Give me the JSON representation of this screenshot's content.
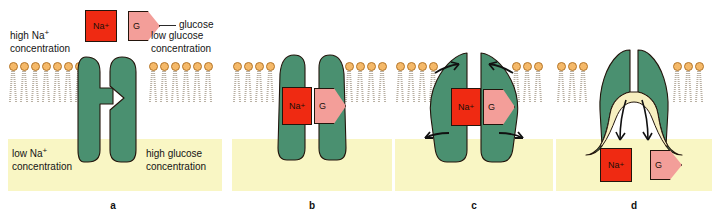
{
  "figure": {
    "colors": {
      "protein_green": "#4a9070",
      "lipid_head_orange": "#f5b969",
      "lipid_head_outline": "#b4762a",
      "lipid_tail_gray": "#b9b0a3",
      "cytoplasm_yellow": "#f9f6c4",
      "sodium_red": "#ef2a12",
      "glucose_pink": "#f39e99",
      "cavity_cream": "#f7efc0",
      "outline_black": "#23150c",
      "background_white": "#ffffff"
    },
    "ligands": {
      "sodium_label": "Na",
      "sodium_charge": "+",
      "glucose_label": "G",
      "glucose_leader_text": "glucose"
    }
  },
  "panels": [
    {
      "id": "a",
      "label": "a",
      "labels": {
        "top_left_line1": "high Na",
        "top_left_sup": "+",
        "top_left_line2": "concentration",
        "top_right_line1": "low glucose",
        "top_right_line2": "concentration",
        "bottom_left_line1": "low Na",
        "bottom_left_sup": "+",
        "bottom_left_line2": "concentration",
        "bottom_right_line1": "high glucose",
        "bottom_right_line2": "concentration"
      },
      "state": "open-outward, unbound",
      "free_ligands": [
        "sodium",
        "glucose"
      ]
    },
    {
      "id": "b",
      "label": "b",
      "state": "ligands bound in outward-open pocket",
      "bound_ligands": [
        "sodium",
        "glucose"
      ]
    },
    {
      "id": "c",
      "label": "c",
      "state": "conformational change, rotation arrows",
      "bound_ligands": [
        "sodium",
        "glucose"
      ],
      "arrows": 4
    },
    {
      "id": "d",
      "label": "d",
      "state": "inward-open, ligands released to cytoplasm",
      "released_ligands": [
        "sodium",
        "glucose"
      ],
      "arrows": 2
    }
  ]
}
